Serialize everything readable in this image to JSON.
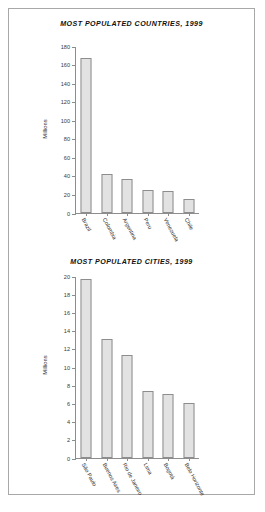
{
  "page": {
    "frame_border_color": "#a8a8a8",
    "background": "#ffffff"
  },
  "chart_data": [
    {
      "type": "bar",
      "title": "MOST POPULATED COUNTRIES, 1999",
      "xlabel": "",
      "ylabel": "Millions",
      "categories": [
        "Brazil",
        "Colombia",
        "Argentina",
        "Peru",
        "Venezuela",
        "Chile"
      ],
      "values": [
        168,
        42,
        37,
        25,
        24,
        15
      ],
      "ylim": [
        0,
        180
      ],
      "yticks": [
        0,
        20,
        40,
        60,
        80,
        100,
        120,
        140,
        160,
        180
      ],
      "ytick_labels": [
        "0",
        "20",
        "40",
        "60",
        "80",
        "100",
        "120",
        "140",
        "160",
        "180"
      ],
      "grid": false,
      "legend": false,
      "bar_fill": "#e2e2e2",
      "bar_edge": "#8d8d8d"
    },
    {
      "type": "bar",
      "title": "MOST POPULATED CITIES, 1999",
      "xlabel": "",
      "ylabel": "Millions",
      "categories": [
        "São Paulo",
        "Buenos Aires",
        "Rio de Janeiro",
        "Lima",
        "Bogotá",
        "Belo Horizonte"
      ],
      "values": [
        19.8,
        13.1,
        11.4,
        7.4,
        7.1,
        6.1
      ],
      "ylim": [
        0,
        20
      ],
      "yticks": [
        0,
        2,
        4,
        6,
        8,
        10,
        12,
        14,
        16,
        18,
        20
      ],
      "ytick_labels": [
        "0",
        "2",
        "4",
        "6",
        "8",
        "10",
        "12",
        "14",
        "16",
        "18",
        "20"
      ],
      "grid": false,
      "legend": false,
      "bar_fill": "#e2e2e2",
      "bar_edge": "#8d8d8d"
    }
  ]
}
